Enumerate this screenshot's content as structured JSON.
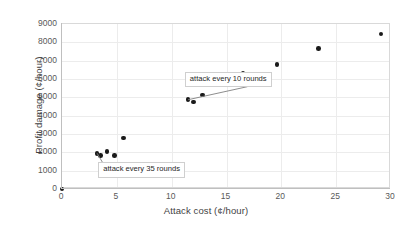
{
  "chart_data": {
    "type": "scatter",
    "title": "",
    "xlabel": "Attack cost (¢/hour)",
    "ylabel": "Profit damage (¢/hour)",
    "xlim": [
      0,
      30
    ],
    "ylim": [
      0,
      9000
    ],
    "xticks": [
      "0",
      "5",
      "10",
      "15",
      "20",
      "25",
      "30"
    ],
    "xtick_values": [
      0,
      5,
      10,
      15,
      20,
      25,
      30
    ],
    "yticks": [
      "0",
      "1000",
      "2000",
      "3000",
      "4000",
      "5000",
      "6000",
      "7000",
      "8000",
      "9000"
    ],
    "ytick_values": [
      0,
      1000,
      2000,
      3000,
      4000,
      5000,
      6000,
      7000,
      8000,
      9000
    ],
    "grid": true,
    "grid_color": "#ececec",
    "legend": "none",
    "marker_color": "#1a1a1a",
    "series": [
      {
        "name": "attack scenarios",
        "x": [
          0,
          3.2,
          3.5,
          4.1,
          4.8,
          5.6,
          11.5,
          12.0,
          12.8,
          14.3,
          16.5,
          19.6,
          23.4,
          29.1
        ],
        "y": [
          0,
          1950,
          1830,
          2060,
          1820,
          2780,
          4870,
          4750,
          5130,
          5900,
          6300,
          6780,
          7650,
          8450
        ]
      }
    ],
    "annotations": [
      {
        "text": "attack every 10 rounds",
        "box_x": 11.2,
        "box_y": 6400,
        "target_x": 11.5,
        "target_y": 4870
      },
      {
        "text": "attack every 35 rounds",
        "box_x": 3.3,
        "box_y": 1450,
        "target_x": 3.2,
        "target_y": 1950
      }
    ]
  }
}
